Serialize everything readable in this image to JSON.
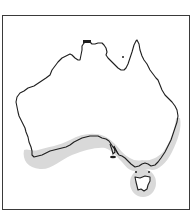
{
  "map": {
    "title": "Australia distribution map",
    "region": "Australia",
    "distribution_area": "southern coast of Australia and Tasmania",
    "colors": {
      "background": "#ffffff",
      "frame": "#3a3a3a",
      "coastline": "#1e1e1e",
      "distribution_shading": "#d9d9d9"
    }
  }
}
